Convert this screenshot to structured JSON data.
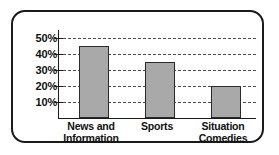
{
  "chart_data": {
    "type": "bar",
    "title": "",
    "xlabel": "",
    "ylabel": "",
    "categories": [
      "News and Information",
      "Sports",
      "Situation Comedies"
    ],
    "category_lines": [
      [
        "News and",
        "Information"
      ],
      [
        "Sports",
        ""
      ],
      [
        "Situation",
        "Comedies"
      ]
    ],
    "values": [
      45,
      35,
      20
    ],
    "ylim": [
      0,
      55
    ],
    "yticks": [
      10,
      20,
      30,
      40,
      50
    ],
    "ytick_labels": [
      "10%",
      "20%",
      "30%",
      "40%",
      "50%"
    ],
    "grid": true,
    "grid_style": "dashed",
    "legend": "none",
    "bar_color": "#a9a9a9",
    "bar_border_color": "#2b2b2b",
    "axis_color": "#1a1a1a",
    "grid_color": "#4d4d4d",
    "frame_color": "#1a1a1a",
    "background": "#ffffff"
  }
}
